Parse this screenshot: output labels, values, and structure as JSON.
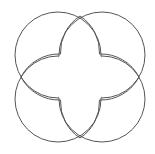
{
  "diagram": {
    "type": "four-overlapping-circles",
    "stroke_color": "#555555",
    "background": "#ffffff",
    "circles": [
      {
        "name": "top-left",
        "cx": 58,
        "cy": 55,
        "r": 43
      },
      {
        "name": "top-right",
        "cx": 102,
        "cy": 55,
        "r": 43
      },
      {
        "name": "bottom-left",
        "cx": 58,
        "cy": 99,
        "r": 43
      },
      {
        "name": "bottom-right",
        "cx": 102,
        "cy": 99,
        "r": 43
      }
    ],
    "center_shape": "four-lobed clover (interior lines hidden)"
  }
}
